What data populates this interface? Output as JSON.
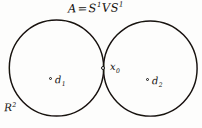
{
  "figure": {
    "caption_top": "A = S¹ V S¹",
    "background_color": "#fdfdfc",
    "ink_color": "#161616"
  },
  "labels": {
    "space": {
      "name": "A",
      "equals": "=",
      "first_circle": "S",
      "first_exponent": "1",
      "wedge": "V",
      "second_circle": "S",
      "second_exponent": "1"
    },
    "basepoint": {
      "symbol": "x",
      "subscript": "0"
    },
    "disk_1": {
      "symbol": "d",
      "subscript": "1"
    },
    "disk_2": {
      "symbol": "d",
      "subscript": "2"
    },
    "plane": {
      "symbol": "R",
      "exponent": "2"
    }
  },
  "geometry": {
    "left_circle": {
      "center_x": 56.5,
      "center_y": 68,
      "radius": 47.5,
      "stroke_width": 1.4
    },
    "right_circle": {
      "center_x": 150.5,
      "center_y": 68.5,
      "radius": 47,
      "stroke_width": 1.4
    },
    "tangency_point": {
      "x": 103,
      "y": 68
    },
    "marks": [
      {
        "name": "disk-1-center",
        "x": 50.5,
        "y": 78.5
      },
      {
        "name": "disk-2-center",
        "x": 147.5,
        "y": 79.5
      },
      {
        "name": "basepoint",
        "x": 103,
        "y": 68
      }
    ]
  }
}
